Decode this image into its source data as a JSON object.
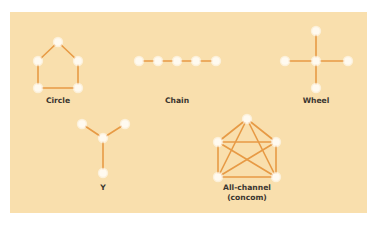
{
  "colors": {
    "background": "#f9dfad",
    "edge": "#e79a45",
    "node": "#fffaf0",
    "label": "#3b3630"
  },
  "networks": [
    {
      "name": "Circle",
      "label_lines": [
        "Circle"
      ],
      "label_pos": [
        58,
        103
      ],
      "nodes": [
        [
          58,
          42
        ],
        [
          38,
          61
        ],
        [
          78,
          61
        ],
        [
          38,
          88
        ],
        [
          78,
          88
        ]
      ],
      "edges": [
        [
          0,
          1
        ],
        [
          0,
          2
        ],
        [
          1,
          3
        ],
        [
          2,
          4
        ],
        [
          3,
          4
        ]
      ]
    },
    {
      "name": "Chain",
      "label_lines": [
        "Chain"
      ],
      "label_pos": [
        177,
        103
      ],
      "nodes": [
        [
          139,
          61
        ],
        [
          158,
          61
        ],
        [
          177,
          61
        ],
        [
          196,
          61
        ],
        [
          216,
          61
        ]
      ],
      "edges": [
        [
          0,
          1
        ],
        [
          1,
          2
        ],
        [
          2,
          3
        ],
        [
          3,
          4
        ]
      ]
    },
    {
      "name": "Wheel",
      "label_lines": [
        "Wheel"
      ],
      "label_pos": [
        316,
        103
      ],
      "nodes": [
        [
          316,
          61
        ],
        [
          316,
          31
        ],
        [
          285,
          61
        ],
        [
          348,
          61
        ],
        [
          316,
          88
        ]
      ],
      "edges": [
        [
          0,
          1
        ],
        [
          0,
          2
        ],
        [
          0,
          3
        ],
        [
          0,
          4
        ]
      ]
    },
    {
      "name": "Y",
      "label_lines": [
        "Y"
      ],
      "label_pos": [
        103,
        190
      ],
      "nodes": [
        [
          82,
          124
        ],
        [
          125,
          124
        ],
        [
          103,
          138
        ],
        [
          103,
          173
        ]
      ],
      "edges": [
        [
          0,
          2
        ],
        [
          1,
          2
        ],
        [
          2,
          3
        ]
      ]
    },
    {
      "name": "All-channel",
      "label_lines": [
        "All-channel",
        "(concom)"
      ],
      "label_pos": [
        247,
        190
      ],
      "nodes": [
        [
          247,
          119
        ],
        [
          218,
          142
        ],
        [
          276,
          142
        ],
        [
          218,
          177
        ],
        [
          276,
          177
        ]
      ],
      "edges": [
        [
          0,
          1
        ],
        [
          0,
          2
        ],
        [
          0,
          3
        ],
        [
          0,
          4
        ],
        [
          1,
          2
        ],
        [
          1,
          3
        ],
        [
          1,
          4
        ],
        [
          2,
          3
        ],
        [
          2,
          4
        ],
        [
          3,
          4
        ]
      ]
    }
  ]
}
